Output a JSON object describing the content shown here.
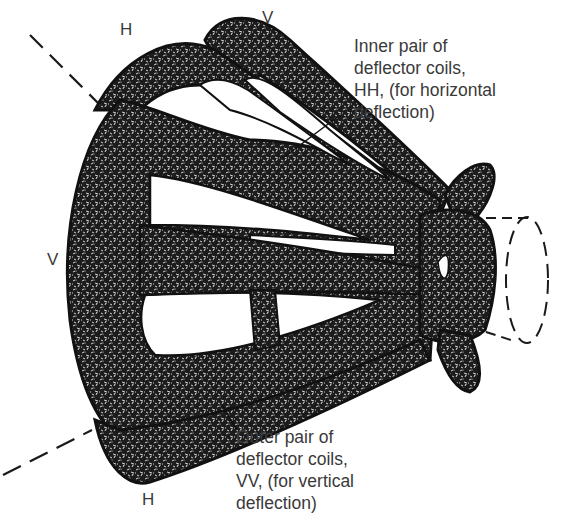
{
  "diagram": {
    "labels": {
      "h_top": "H",
      "v_top": "V",
      "v_left": "V",
      "h_bottom": "H"
    },
    "callouts": {
      "inner": "Inner pair of\ndeflector coils,\nHH, (for horizontal\ndeflection)",
      "outer": "Outer pair of\ndeflector coils,\nVV, (for vertical\ndeflection)"
    },
    "colors": {
      "ink": "#1a1a1a",
      "text": "#3a3a3a",
      "background": "#ffffff"
    }
  }
}
